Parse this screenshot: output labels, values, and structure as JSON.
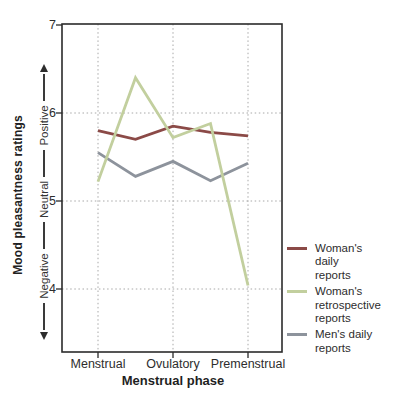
{
  "chart_data": {
    "type": "line",
    "x_axis": {
      "title": "Menstrual phase",
      "labels": [
        "Menstrual",
        "Ovulatory",
        "Premenstrual"
      ],
      "label_positions": [
        0,
        2,
        4
      ],
      "n_points": 5
    },
    "y_axis": {
      "title": "Mood pleasantness ratings",
      "ticks": [
        7,
        6,
        5,
        4
      ],
      "tick_labels": [
        "7",
        "6",
        "5",
        "4"
      ],
      "range_top": 7,
      "range_bottom": 3.3,
      "direction_labels": {
        "top": "Positive",
        "middle": "Neutral",
        "bottom": "Negative"
      }
    },
    "grid": {
      "style": "dotted",
      "horizontal_at": [
        6,
        5,
        4
      ]
    },
    "series": [
      {
        "name": "womans-daily-reports",
        "label": "Woman's\ndaily\nreports",
        "color": "#8b4a47",
        "values": [
          5.8,
          5.7,
          5.85,
          5.78,
          5.74
        ]
      },
      {
        "name": "womans-retrospective-reports",
        "label": "Woman's\nretrospective\nreports",
        "color": "#c2cf9e",
        "values": [
          5.22,
          6.4,
          5.72,
          5.88,
          4.04
        ]
      },
      {
        "name": "mens-daily-reports",
        "label": "Men's daily\nreports",
        "color": "#8d939c",
        "values": [
          5.55,
          5.28,
          5.45,
          5.23,
          5.43
        ]
      }
    ],
    "colors": {
      "axis": "#2b2b2b",
      "grid": "#a8a8a8",
      "text": "#2d2d2d"
    }
  }
}
